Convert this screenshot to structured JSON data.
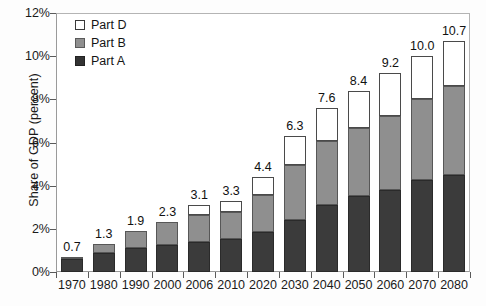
{
  "chart_data": {
    "type": "bar",
    "stacked": true,
    "title": "",
    "xlabel": "",
    "ylabel": "Share of GDP (percent)",
    "ylim": [
      0,
      12
    ],
    "yticks": [
      "0%",
      "2%",
      "4%",
      "6%",
      "8%",
      "10%",
      "12%"
    ],
    "ytick_values": [
      0,
      2,
      4,
      6,
      8,
      10,
      12
    ],
    "grid": false,
    "legend_position": "top-left",
    "categories": [
      "1970",
      "1980",
      "1990",
      "2000",
      "2006",
      "2010",
      "2020",
      "2030",
      "2040",
      "2050",
      "2060",
      "2070",
      "2080"
    ],
    "series": [
      {
        "name": "Part A",
        "color": "#3b3b3b",
        "values": [
          0.6,
          0.9,
          1.1,
          1.25,
          1.4,
          1.55,
          1.85,
          2.4,
          3.1,
          3.5,
          3.8,
          4.25,
          4.5
        ]
      },
      {
        "name": "Part B",
        "color": "#8f8f8f",
        "values": [
          0.1,
          0.4,
          0.8,
          1.05,
          1.25,
          1.25,
          1.7,
          2.55,
          2.95,
          3.15,
          3.45,
          3.75,
          4.1
        ]
      },
      {
        "name": "Part D",
        "color": "#ffffff",
        "values": [
          0.0,
          0.0,
          0.0,
          0.0,
          0.45,
          0.5,
          0.85,
          1.35,
          1.55,
          1.75,
          1.95,
          2.0,
          2.1
        ]
      }
    ],
    "totals": [
      0.7,
      1.3,
      1.9,
      2.3,
      3.1,
      3.3,
      4.4,
      6.3,
      7.6,
      8.4,
      9.2,
      10.0,
      10.7
    ],
    "data_labels": [
      "0.7",
      "1.3",
      "1.9",
      "2.3",
      "3.1",
      "3.3",
      "4.4",
      "6.3",
      "7.6",
      "8.4",
      "9.2",
      "10.0",
      "10.7"
    ]
  },
  "legend": {
    "items": [
      {
        "label": "Part D",
        "swatch": "white-square-icon"
      },
      {
        "label": "Part B",
        "swatch": "gray-square-icon"
      },
      {
        "label": "Part A",
        "swatch": "dark-square-icon"
      }
    ]
  },
  "colors": {
    "part_a": "#3b3b3b",
    "part_b": "#8f8f8f",
    "part_d": "#ffffff",
    "axis": "#5a5a5a",
    "text": "#141414"
  }
}
